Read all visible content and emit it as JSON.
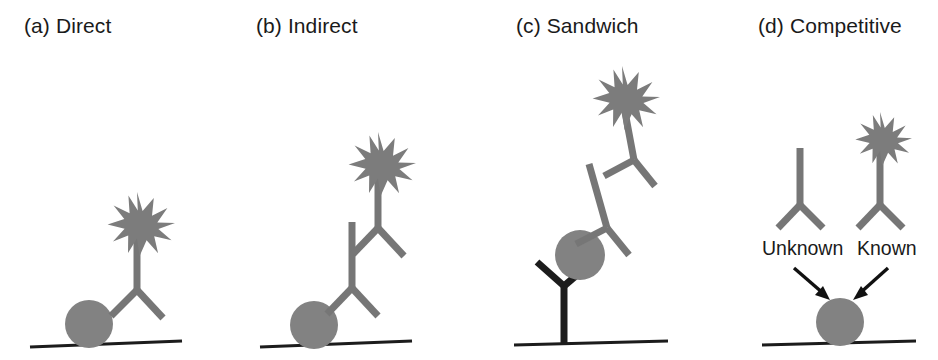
{
  "figure": {
    "background_color": "#ffffff",
    "colors": {
      "antibody_gray": "#767676",
      "antibody_black": "#1c1c1c",
      "antigen_gray": "#828282",
      "enzyme_label_gray": "#7c7c7c",
      "baseline_black": "#1c1c1c",
      "text_black": "#1a1a1a"
    }
  },
  "panels": [
    {
      "id": "direct",
      "label": "(a) Direct",
      "components": {
        "antigen": "antigen-circle",
        "antibodies": [
          "labeled-detection-antibody"
        ],
        "enzyme_labels": 1,
        "baseline": "solid-plate-surface"
      }
    },
    {
      "id": "indirect",
      "label": "(b) Indirect",
      "components": {
        "antigen": "antigen-circle",
        "antibodies": [
          "primary-antibody",
          "labeled-secondary-antibody"
        ],
        "enzyme_labels": 1,
        "baseline": "solid-plate-surface"
      }
    },
    {
      "id": "sandwich",
      "label": "(c) Sandwich",
      "components": {
        "antigen": "antigen-circle",
        "antibodies": [
          "capture-antibody",
          "primary-antibody",
          "labeled-secondary-antibody"
        ],
        "enzyme_labels": 1,
        "baseline": "solid-plate-surface"
      }
    },
    {
      "id": "competitive",
      "label": "(d) Competitive",
      "components": {
        "antigen": "antigen-circle",
        "antibodies": [
          "unknown-antibody",
          "labeled-known-antibody"
        ],
        "enzyme_labels": 1,
        "baseline": "solid-plate-surface",
        "arrows": 2
      },
      "annotations": [
        {
          "id": "unknown",
          "text": "Unknown"
        },
        {
          "id": "known",
          "text": "Known"
        }
      ]
    }
  ]
}
